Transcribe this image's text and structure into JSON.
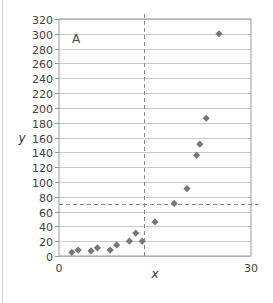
{
  "chart_data": {
    "type": "scatter",
    "title": "",
    "panel_label": "A",
    "xlabel": "x",
    "ylabel": "y",
    "xlim": [
      0,
      30
    ],
    "ylim": [
      0,
      320
    ],
    "x_ticks": [
      0,
      30
    ],
    "y_ticks": [
      0,
      20,
      40,
      60,
      80,
      100,
      120,
      140,
      160,
      180,
      200,
      220,
      240,
      260,
      280,
      300,
      320
    ],
    "grid": {
      "horizontal": true,
      "vertical": false
    },
    "legend": null,
    "marker": "diamond",
    "marker_color": "#777777",
    "series": [
      {
        "name": "data",
        "points": [
          {
            "x": 2,
            "y": 5
          },
          {
            "x": 3,
            "y": 8
          },
          {
            "x": 5,
            "y": 7
          },
          {
            "x": 6,
            "y": 11
          },
          {
            "x": 8,
            "y": 8
          },
          {
            "x": 9,
            "y": 15
          },
          {
            "x": 11,
            "y": 20
          },
          {
            "x": 12,
            "y": 31
          },
          {
            "x": 13,
            "y": 20
          },
          {
            "x": 15,
            "y": 46
          },
          {
            "x": 18,
            "y": 71
          },
          {
            "x": 20,
            "y": 91
          },
          {
            "x": 21.5,
            "y": 136
          },
          {
            "x": 22,
            "y": 151
          },
          {
            "x": 23,
            "y": 186
          },
          {
            "x": 25,
            "y": 300
          }
        ]
      }
    ],
    "reference_lines": [
      {
        "orientation": "vertical",
        "value": 13.3,
        "style": "dashed"
      },
      {
        "orientation": "horizontal",
        "value": 70,
        "style": "dashed"
      }
    ]
  }
}
